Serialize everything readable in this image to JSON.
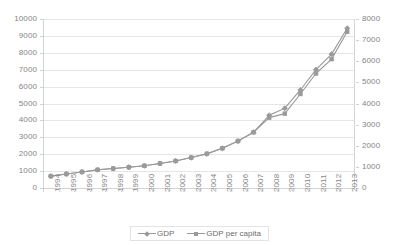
{
  "chart_data": {
    "type": "line",
    "title": "",
    "subtitle": "",
    "xlabel": "",
    "ylabel": "",
    "grid": "horizontal",
    "legend_position": "bottom-center",
    "categories": [
      "1994",
      "1995",
      "1996",
      "1997",
      "1998",
      "1999",
      "2000",
      "2001",
      "2002",
      "2003",
      "2004",
      "2005",
      "2006",
      "2007",
      "2008",
      "2009",
      "2010",
      "2011",
      "2012",
      "2013"
    ],
    "axes": {
      "left": {
        "label": "",
        "min": 0,
        "max": 10000,
        "step": 1000,
        "ticks": [
          "0",
          "1000",
          "2000",
          "3000",
          "4000",
          "5000",
          "6000",
          "7000",
          "8000",
          "9000",
          "10000"
        ]
      },
      "right": {
        "label": "",
        "min": 0,
        "max": 8000,
        "step": 1000,
        "ticks": [
          "0",
          "1000",
          "2000",
          "3000",
          "4000",
          "5000",
          "6000",
          "7000",
          "8000"
        ]
      }
    },
    "series": [
      {
        "name": "GDP",
        "axis": "left",
        "marker": "diamond",
        "color": "#9a9a9a",
        "values": [
          700,
          830,
          950,
          1080,
          1150,
          1230,
          1320,
          1450,
          1600,
          1800,
          2020,
          2350,
          2780,
          3300,
          4300,
          4720,
          5800,
          7000,
          7920,
          9450
        ]
      },
      {
        "name": "GDP per capita",
        "axis": "right",
        "marker": "square",
        "color": "#9a9a9a",
        "values": [
          560,
          660,
          760,
          860,
          920,
          980,
          1050,
          1160,
          1280,
          1440,
          1620,
          1880,
          2220,
          2640,
          3330,
          3520,
          4450,
          5420,
          6100,
          7400
        ]
      }
    ]
  },
  "legend": {
    "entries": [
      {
        "label": "GDP",
        "marker": "diamond"
      },
      {
        "label": "GDP per capita",
        "marker": "square"
      }
    ]
  },
  "colors": {
    "series": "#9a9a9a",
    "gridline": "#e6e6e6",
    "axis": "#d4d4d4",
    "tick_text": "#858585",
    "legend_text": "#6d6d6d",
    "background": "#ffffff"
  }
}
